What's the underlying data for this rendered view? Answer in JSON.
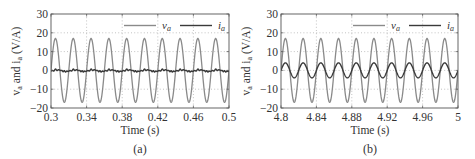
{
  "figure": {
    "panels": [
      {
        "id": "a",
        "caption": "(a)",
        "xlabel": "Time (s)",
        "ylabel_main": "v",
        "ylabel_sub1": "a",
        "ylabel_mid": " and i",
        "ylabel_sub2": "a",
        "ylabel_unit": " (V/A)",
        "xticks": [
          "0.3",
          "0.34",
          "0.38",
          "0.42",
          "0.46",
          "0.5"
        ],
        "yticks": [
          "30",
          "20",
          "10",
          "0",
          "−10",
          "−20"
        ],
        "legend": [
          {
            "symbol": "v",
            "sub": "a"
          },
          {
            "symbol": "i",
            "sub": "a"
          }
        ]
      },
      {
        "id": "b",
        "caption": "(b)",
        "xlabel": "Time (s)",
        "ylabel_main": "v",
        "ylabel_sub1": "a",
        "ylabel_mid": " and i",
        "ylabel_sub2": "a",
        "ylabel_unit": " (V/A)",
        "xticks": [
          "4.8",
          "4.84",
          "4.88",
          "4.92",
          "4.96",
          "5"
        ],
        "yticks": [
          "30",
          "20",
          "10",
          "0",
          "−10",
          "−20"
        ],
        "legend": [
          {
            "symbol": "v",
            "sub": "a"
          },
          {
            "symbol": "i",
            "sub": "a"
          }
        ]
      }
    ],
    "colors": {
      "voltage": "#8a8a8a",
      "current": "#3a3a3a",
      "axis": "#555555",
      "grid": "#9a9a9a"
    }
  },
  "chart_data": [
    {
      "type": "line",
      "title": "(a)",
      "xlabel": "Time (s)",
      "ylabel": "v_a and i_a (V/A)",
      "xlim": [
        0.3,
        0.5
      ],
      "ylim": [
        -20,
        30
      ],
      "xticks": [
        0.3,
        0.34,
        0.38,
        0.42,
        0.46,
        0.5
      ],
      "yticks": [
        -20,
        -10,
        0,
        10,
        20,
        30
      ],
      "grid": true,
      "legend_position": "upper right",
      "series": [
        {
          "name": "v_a",
          "kind": "sinusoid",
          "amplitude": 17,
          "frequency_hz": 50,
          "offset": 0,
          "color": "#8a8a8a"
        },
        {
          "name": "i_a",
          "kind": "distorted small ripple",
          "amplitude": 1,
          "frequency_hz": 50,
          "offset": 0,
          "color": "#3a3a3a"
        }
      ]
    },
    {
      "type": "line",
      "title": "(b)",
      "xlabel": "Time (s)",
      "ylabel": "v_a and i_a (V/A)",
      "xlim": [
        4.8,
        5.0
      ],
      "ylim": [
        -20,
        30
      ],
      "xticks": [
        4.8,
        4.84,
        4.88,
        4.92,
        4.96,
        5.0
      ],
      "yticks": [
        -20,
        -10,
        0,
        10,
        20,
        30
      ],
      "grid": true,
      "legend_position": "upper right",
      "series": [
        {
          "name": "v_a",
          "kind": "sinusoid",
          "amplitude": 17,
          "frequency_hz": 50,
          "offset": 0,
          "color": "#8a8a8a"
        },
        {
          "name": "i_a",
          "kind": "sinusoid",
          "amplitude": 4,
          "frequency_hz": 50,
          "offset": 0,
          "color": "#3a3a3a"
        }
      ]
    }
  ]
}
